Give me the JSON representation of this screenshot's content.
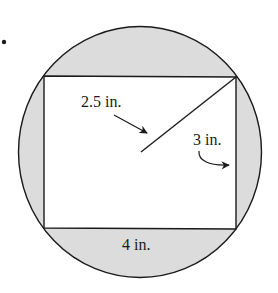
{
  "diagram": {
    "type": "rectangle inscribed in circle",
    "colors": {
      "shaded_region": "#dcdcdc",
      "inner_rectangle": "#ffffff",
      "stroke": "#1a1a1a",
      "background": "#ffffff"
    },
    "bullet": "•",
    "labels": {
      "radius": "2.5 in.",
      "height": "3 in.",
      "width": "4 in."
    },
    "dimensions": {
      "radius_in": 2.5,
      "rect_width_in": 4,
      "rect_height_in": 3
    }
  }
}
